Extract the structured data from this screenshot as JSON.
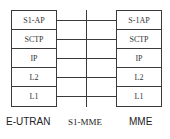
{
  "diagram": {
    "left_node": {
      "name": "E-UTRAN",
      "layers": [
        "S1-AP",
        "SCTP",
        "IP",
        "L2",
        "L1"
      ]
    },
    "right_node": {
      "name": "MME",
      "layers": [
        "S-1AP",
        "SCTP",
        "IP",
        "L2",
        "L1"
      ]
    },
    "interface_label": "S1-MME",
    "line_color": "#3a3a3a"
  }
}
